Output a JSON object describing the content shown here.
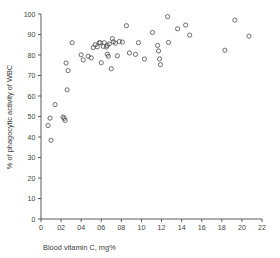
{
  "chart_data": {
    "type": "scatter",
    "title": "",
    "subtitle": "",
    "xlabel": "Blood vitamin C, mg%",
    "ylabel": "% of phagocytic activity of WBC",
    "xlim": [
      0,
      2.2
    ],
    "ylim": [
      0,
      100
    ],
    "xticks": [
      0,
      0.2,
      0.4,
      0.6,
      0.8,
      1.0,
      1.2,
      1.4,
      1.6,
      1.8,
      2.0,
      2.2
    ],
    "xtick_labels": [
      "0",
      "02",
      "04",
      "06",
      "08",
      "10",
      "12",
      "14",
      "16",
      "18",
      "20",
      "22"
    ],
    "yticks": [
      0,
      10,
      20,
      30,
      40,
      50,
      60,
      70,
      80,
      90,
      100
    ],
    "ytick_labels": [
      "0",
      "10",
      "20",
      "30",
      "40",
      "50",
      "60",
      "70",
      "80",
      "90",
      "100"
    ],
    "grid": false,
    "legend": false,
    "marker": "open-circle",
    "marker_radius": 2.1,
    "marker_color": "#555555",
    "series": [
      {
        "name": "phagocytic activity vs blood vitamin C",
        "points": [
          [
            0.07,
            45.6
          ],
          [
            0.09,
            49.2
          ],
          [
            0.1,
            38.4
          ],
          [
            0.14,
            55.8
          ],
          [
            0.22,
            49.8
          ],
          [
            0.23,
            49.1
          ],
          [
            0.24,
            48.1
          ],
          [
            0.25,
            76.1
          ],
          [
            0.26,
            63.0
          ],
          [
            0.27,
            72.4
          ],
          [
            0.31,
            86.0
          ],
          [
            0.4,
            80.1
          ],
          [
            0.42,
            77.6
          ],
          [
            0.47,
            79.4
          ],
          [
            0.5,
            78.6
          ],
          [
            0.52,
            83.6
          ],
          [
            0.54,
            85.0
          ],
          [
            0.56,
            84.0
          ],
          [
            0.58,
            86.0
          ],
          [
            0.59,
            86.0
          ],
          [
            0.6,
            76.2
          ],
          [
            0.62,
            84.2
          ],
          [
            0.63,
            86.0
          ],
          [
            0.65,
            83.9
          ],
          [
            0.66,
            84.7
          ],
          [
            0.66,
            80.4
          ],
          [
            0.67,
            79.4
          ],
          [
            0.68,
            85.4
          ],
          [
            0.7,
            73.3
          ],
          [
            0.71,
            88.0
          ],
          [
            0.72,
            86.4
          ],
          [
            0.74,
            85.8
          ],
          [
            0.76,
            79.6
          ],
          [
            0.78,
            86.6
          ],
          [
            0.81,
            86.3
          ],
          [
            0.85,
            94.3
          ],
          [
            0.88,
            81.0
          ],
          [
            0.94,
            80.3
          ],
          [
            0.97,
            86.0
          ],
          [
            1.03,
            78.0
          ],
          [
            1.11,
            91.0
          ],
          [
            1.16,
            84.7
          ],
          [
            1.17,
            82.0
          ],
          [
            1.18,
            78.1
          ],
          [
            1.19,
            75.3
          ],
          [
            1.26,
            98.7
          ],
          [
            1.27,
            86.1
          ],
          [
            1.36,
            92.8
          ],
          [
            1.44,
            94.6
          ],
          [
            1.48,
            89.7
          ],
          [
            1.83,
            82.3
          ],
          [
            1.93,
            97.0
          ],
          [
            2.07,
            89.2
          ]
        ]
      }
    ]
  },
  "figure": {
    "background_color": "#ffffff",
    "axis_color": "#4a4a4a",
    "text_color": "#3a3a3a"
  }
}
